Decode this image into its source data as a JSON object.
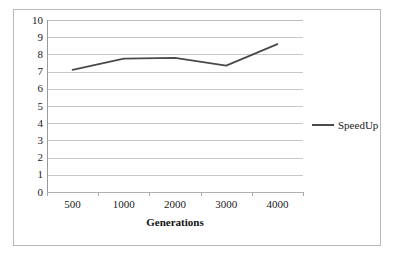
{
  "chart_data": {
    "type": "line",
    "title": "",
    "xlabel": "Generations",
    "ylabel": "",
    "categories": [
      "500",
      "1000",
      "2000",
      "3000",
      "4000"
    ],
    "series": [
      {
        "name": "SpeedUp",
        "values": [
          7.1,
          7.75,
          7.8,
          7.35,
          8.6
        ],
        "color": "#4a4a4a"
      }
    ],
    "ylim": [
      0,
      10
    ],
    "y_ticks": [
      "0",
      "1",
      "2",
      "3",
      "4",
      "5",
      "6",
      "7",
      "8",
      "9",
      "10"
    ],
    "grid": true,
    "legend_position": "right",
    "legend_entries": [
      "SpeedUp"
    ]
  },
  "axis": {
    "x_title": "Generations"
  },
  "legend": {
    "speedup_label": "SpeedUp"
  }
}
